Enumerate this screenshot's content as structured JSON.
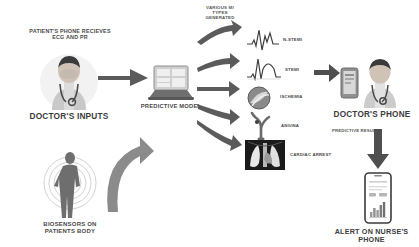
{
  "diagram": {
    "background": "#ffffff",
    "arrow_color": "#5a5a5a",
    "accent_color": "#6f6f6f"
  },
  "inputs": {
    "patient_phone_caption": "PATIENT'S PHONE RECIEVES\nECG AND PR",
    "doctor_inputs_caption": "DOCTOR'S INPUTS",
    "biosensors_caption": "BIOSENSORS ON\nPATIENTS BODY"
  },
  "model": {
    "caption": "PREDICTIVE MODEL",
    "mi_types_caption": "VARIOUS MI\nTYPES\nGENERATED"
  },
  "outcomes": [
    {
      "label": "N-STEMI",
      "icon": "ecg-waveform-icon"
    },
    {
      "label": "STEMI",
      "icon": "ecg-waveform-icon"
    },
    {
      "label": "ISCHEMIA",
      "icon": "artery-cross-section-icon"
    },
    {
      "label": "ANGINA",
      "icon": "coronary-artery-icon"
    },
    {
      "label": "CARDIAC ARREST",
      "icon": "chest-xray-icon"
    }
  ],
  "output": {
    "doctor_phone_caption": "DOCTOR'S PHONE",
    "predictive_result_caption": "PREDICTIVE RESULT",
    "nurse_phone_caption": "ALERT ON NURSE'S PHONE"
  }
}
